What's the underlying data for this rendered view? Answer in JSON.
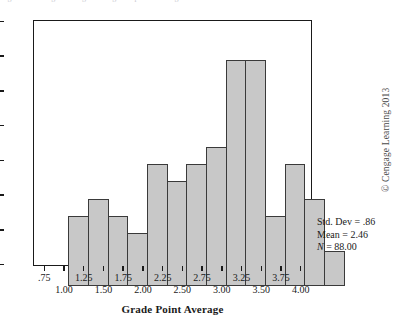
{
  "figure": {
    "top_clipped_text": "Figure showing a histogram of grade point averages",
    "axis_title": "Grade Point Average",
    "copyright": "© Cengage Learning 2013"
  },
  "stats": {
    "std_dev_label": "Std. Dev = .86",
    "mean_label": "Mean = 2.46",
    "n_symbol": "N",
    "n_value": " = 88.00"
  },
  "colors": {
    "bar_fill": "#c8c8c8",
    "bar_stroke": "#3a3a3a",
    "axis": "#1a1a1a",
    "background": "#ffffff"
  },
  "chart_data": {
    "type": "bar",
    "title": "",
    "subtitle": "",
    "xlabel": "Grade Point Average",
    "ylabel": "",
    "categories": [
      ".75",
      "1.00",
      "1.25",
      "1.50",
      "1.75",
      "2.00",
      "2.25",
      "2.50",
      "2.75",
      "3.00",
      "3.25",
      "3.50",
      "3.75",
      "4.00"
    ],
    "values": [
      4,
      5,
      4,
      3,
      7,
      6,
      7,
      8,
      13,
      13,
      4,
      7,
      5,
      2
    ],
    "bar_count": 14,
    "total_count": 88,
    "x_tick_labels_row_a": [
      ".75",
      "1.25",
      "1.75",
      "2.25",
      "2.75",
      "3.25",
      "3.75"
    ],
    "x_tick_labels_row_b": [
      "1.00",
      "1.50",
      "2.00",
      "2.50",
      "3.00",
      "3.50",
      "4.00"
    ],
    "x_tick_labels_staggered": true,
    "ylim": [
      0,
      14
    ],
    "y_ticks": [
      0,
      2,
      4,
      6,
      8,
      10,
      12,
      14
    ],
    "y_tick_labels": [
      "0",
      "2",
      "4",
      "6",
      "8",
      "10",
      "12",
      "14"
    ],
    "grid": false,
    "legend": false,
    "legend_position": "none",
    "annotations": [
      "Std. Dev = .86",
      "Mean = 2.46",
      "N = 88.00"
    ]
  }
}
